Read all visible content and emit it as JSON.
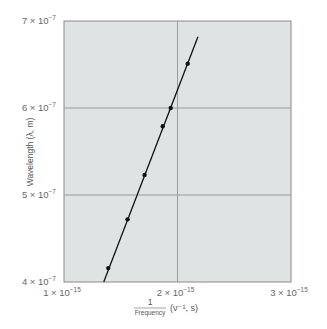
{
  "chart_data": {
    "type": "scatter",
    "title": "",
    "xlabel": "1 / Frequency (ν⁻¹, s)",
    "xlabel_parts": {
      "numerator": "1",
      "denominator": "Frequency",
      "units": "(ν⁻¹, s)"
    },
    "ylabel": "Wavelength (λ, m)",
    "xlim": [
      1e-15,
      3e-15
    ],
    "ylim": [
      4e-07,
      7e-07
    ],
    "grid": true,
    "x_ticks": [
      {
        "value": 1e-15,
        "label": "1 × 10",
        "exp": "−15"
      },
      {
        "value": 2e-15,
        "label": "2 × 10",
        "exp": "−15"
      },
      {
        "value": 3e-15,
        "label": "3 × 10",
        "exp": "−15"
      }
    ],
    "y_ticks": [
      {
        "value": 4e-07,
        "label": "4 × 10",
        "exp": "−7"
      },
      {
        "value": 5e-07,
        "label": "5 × 10",
        "exp": "−7"
      },
      {
        "value": 6e-07,
        "label": "6 × 10",
        "exp": "−7"
      },
      {
        "value": 7e-07,
        "label": "7 × 10",
        "exp": "−7"
      }
    ],
    "series": [
      {
        "name": "measurements",
        "x": [
          1.39e-15,
          1.56e-15,
          1.71e-15,
          1.87e-15,
          1.94e-15,
          2.09e-15
        ],
        "y": [
          4.16e-07,
          4.72e-07,
          5.23e-07,
          5.79e-07,
          6e-07,
          6.51e-07
        ]
      }
    ],
    "fit_line": {
      "x": [
        1.35e-15,
        2.18e-15
      ],
      "y": [
        4e-07,
        6.82e-07
      ]
    },
    "colors": {
      "background": "#dfe3e4",
      "grid": "#9a9a9a",
      "axis": "#777777",
      "data": "#111111"
    }
  }
}
